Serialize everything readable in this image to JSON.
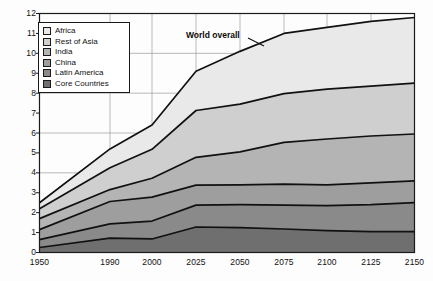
{
  "chart_data": {
    "type": "area",
    "stacked": true,
    "title": "",
    "xlabel": "",
    "ylabel": "",
    "annotation": "World overall",
    "legend_position": "top-left",
    "grid": true,
    "x": [
      1950,
      1990,
      2000,
      2025,
      2050,
      2075,
      2100,
      2125,
      2150
    ],
    "xtick_labels": [
      "1950",
      "1990",
      "2000",
      "2025",
      "2050",
      "2075",
      "2100",
      "2125",
      "2150"
    ],
    "ytick_labels": [
      "0",
      "1",
      "2",
      "3",
      "4",
      "5",
      "6",
      "7",
      "8",
      "9",
      "10",
      "11",
      "12"
    ],
    "ylim": [
      0,
      12
    ],
    "xlim": [
      1950,
      2150
    ],
    "series": [
      {
        "name": "Core Countries",
        "color": "#6f6f6f",
        "values": [
          0.25,
          0.72,
          0.68,
          1.28,
          1.25,
          1.18,
          1.1,
          1.05,
          1.05
        ]
      },
      {
        "name": "Latin America",
        "color": "#8a8a8a",
        "values": [
          0.4,
          0.72,
          0.9,
          1.1,
          1.15,
          1.2,
          1.25,
          1.35,
          1.45
        ]
      },
      {
        "name": "China",
        "color": "#9e9e9e",
        "values": [
          0.5,
          1.12,
          1.2,
          1.0,
          1.0,
          1.05,
          1.05,
          1.1,
          1.1
        ]
      },
      {
        "name": "India",
        "color": "#b4b4b4",
        "values": [
          0.55,
          0.6,
          0.95,
          1.4,
          1.65,
          2.1,
          2.3,
          2.35,
          2.35
        ]
      },
      {
        "name": "Rest of Asia",
        "color": "#cfcfcf",
        "values": [
          0.5,
          1.1,
          1.45,
          2.35,
          2.4,
          2.45,
          2.5,
          2.5,
          2.55
        ]
      },
      {
        "name": "Africa",
        "color": "#e9e9e9",
        "values": [
          0.3,
          0.94,
          1.22,
          1.97,
          2.65,
          3.02,
          3.1,
          3.25,
          3.3
        ]
      }
    ],
    "cumulative_totals": [
      2.5,
      5.2,
      6.4,
      9.1,
      10.1,
      11.0,
      11.3,
      11.6,
      11.8
    ],
    "cumulative_boundaries": {
      "core_countries": [
        0.25,
        0.72,
        0.68,
        1.28,
        1.25,
        1.18,
        1.1,
        1.05,
        1.05
      ],
      "latin_america": [
        0.65,
        1.44,
        1.58,
        2.38,
        2.4,
        2.38,
        2.35,
        2.4,
        2.5
      ],
      "china": [
        1.15,
        2.56,
        2.78,
        3.38,
        3.4,
        3.43,
        3.4,
        3.5,
        3.6
      ],
      "india": [
        1.7,
        3.16,
        3.73,
        4.78,
        5.05,
        5.53,
        5.7,
        5.85,
        5.95
      ],
      "rest_of_asia": [
        2.2,
        4.26,
        5.18,
        7.13,
        7.45,
        7.98,
        8.2,
        8.35,
        8.5
      ],
      "africa": [
        2.5,
        5.2,
        6.4,
        9.1,
        10.1,
        11.0,
        11.3,
        11.6,
        11.8
      ]
    }
  },
  "legend": {
    "items": [
      {
        "label": "Africa",
        "color": "#e9e9e9"
      },
      {
        "label": "Rest of Asia",
        "color": "#cfcfcf"
      },
      {
        "label": "India",
        "color": "#b4b4b4"
      },
      {
        "label": "China",
        "color": "#9e9e9e"
      },
      {
        "label": "Latin America",
        "color": "#8a8a8a"
      },
      {
        "label": "Core Countries",
        "color": "#6f6f6f"
      }
    ]
  },
  "annotation": {
    "world_overall": "World overall"
  },
  "yticks": [
    "12",
    "11",
    "10",
    "9",
    "8",
    "7",
    "6",
    "5",
    "4",
    "3",
    "2",
    "1",
    "0"
  ],
  "xticks": [
    "1950",
    "1990",
    "2000",
    "2025",
    "2050",
    "2075",
    "2100",
    "2125",
    "2150"
  ]
}
